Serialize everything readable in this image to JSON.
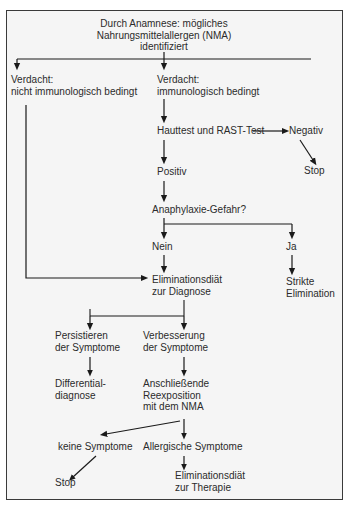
{
  "figure": {
    "type": "flowchart",
    "language": "de",
    "caption_remnant": "",
    "background_color": "#f5f5f5",
    "border_color": "#3a3a3a",
    "text_color": "#2b2b2b",
    "arrow_color": "#1a1a1a"
  },
  "nodes": [
    {
      "id": "start",
      "label": "Durch Anamnese: mögliches\nNahrungsmittelallergen (NMA)\nidentifiziert",
      "x": 164,
      "y": 18,
      "align": "center"
    },
    {
      "id": "verdacht-nicht-immun",
      "label": "Verdacht:\nnicht immunologisch bedingt",
      "x": 11,
      "y": 74,
      "align": "left"
    },
    {
      "id": "verdacht-immun",
      "label": "Verdacht:\nimmunologisch bedingt",
      "x": 157,
      "y": 74,
      "align": "left"
    },
    {
      "id": "hauttest-rast",
      "label": "Hauttest und RAST-Test",
      "x": 157,
      "y": 127,
      "align": "left"
    },
    {
      "id": "negativ",
      "label": "Negativ",
      "x": 292,
      "y": 127,
      "align": "left"
    },
    {
      "id": "stop-negativ",
      "label": "Stop",
      "x": 304,
      "y": 168,
      "align": "left"
    },
    {
      "id": "positiv",
      "label": "Positiv",
      "x": 157,
      "y": 168,
      "align": "left"
    },
    {
      "id": "anaphylaxie-gefahr",
      "label": "Anaphylaxie-Gefahr?",
      "x": 152,
      "y": 205,
      "align": "left"
    },
    {
      "id": "nein",
      "label": "Nein",
      "x": 152,
      "y": 242,
      "align": "left"
    },
    {
      "id": "ja",
      "label": "Ja",
      "x": 286,
      "y": 242,
      "align": "left"
    },
    {
      "id": "strikte-elimination",
      "label": "Strikte\nElimination",
      "x": 286,
      "y": 277,
      "align": "left"
    },
    {
      "id": "eliminationsdiaet-diagnose",
      "label": "Eliminationsdiät\nzur Diagnose",
      "x": 152,
      "y": 275,
      "align": "left"
    },
    {
      "id": "persistieren",
      "label": "Persistieren\nder Symptome",
      "x": 57,
      "y": 331,
      "align": "left"
    },
    {
      "id": "verbesserung",
      "label": "Verbesserung\nder Symptome",
      "x": 143,
      "y": 331,
      "align": "left"
    },
    {
      "id": "differentialdiagnose",
      "label": "Differential-\ndiagnose",
      "x": 57,
      "y": 380,
      "align": "left"
    },
    {
      "id": "reexposition",
      "label": "Anschließende\nReexposition\nmit dem NMA",
      "x": 143,
      "y": 380,
      "align": "left"
    },
    {
      "id": "keine-symptome",
      "label": "keine Symptome",
      "x": 60,
      "y": 443,
      "align": "left"
    },
    {
      "id": "allergische-symptome",
      "label": "Allergische Symptome",
      "x": 143,
      "y": 443,
      "align": "left"
    },
    {
      "id": "stop-keine-symptome",
      "label": "Stop",
      "x": 57,
      "y": 478,
      "align": "left"
    },
    {
      "id": "eliminationsdiaet-therapie",
      "label": "Eliminationsdiät\nzur Therapie",
      "x": 175,
      "y": 472,
      "align": "left"
    }
  ],
  "edges": [
    {
      "from": "start",
      "to": "verdacht-nicht-immun",
      "style": "elbow"
    },
    {
      "from": "start",
      "to": "verdacht-immun",
      "style": "elbow"
    },
    {
      "from": "verdacht-immun",
      "to": "hauttest-rast",
      "style": "straight"
    },
    {
      "from": "hauttest-rast",
      "to": "negativ",
      "style": "horizontal"
    },
    {
      "from": "negativ",
      "to": "stop-negativ",
      "style": "diagonal"
    },
    {
      "from": "hauttest-rast",
      "to": "positiv",
      "style": "straight"
    },
    {
      "from": "positiv",
      "to": "anaphylaxie-gefahr",
      "style": "straight"
    },
    {
      "from": "anaphylaxie-gefahr",
      "to": "nein",
      "style": "straight"
    },
    {
      "from": "anaphylaxie-gefahr",
      "to": "ja",
      "style": "elbow"
    },
    {
      "from": "ja",
      "to": "strikte-elimination",
      "style": "straight"
    },
    {
      "from": "nein",
      "to": "eliminationsdiaet-diagnose",
      "style": "straight"
    },
    {
      "from": "verdacht-nicht-immun",
      "to": "eliminationsdiaet-diagnose",
      "style": "elbow-left"
    },
    {
      "from": "eliminationsdiaet-diagnose",
      "to": "persistieren",
      "style": "elbow"
    },
    {
      "from": "eliminationsdiaet-diagnose",
      "to": "verbesserung",
      "style": "elbow"
    },
    {
      "from": "persistieren",
      "to": "differentialdiagnose",
      "style": "straight"
    },
    {
      "from": "verbesserung",
      "to": "reexposition",
      "style": "straight"
    },
    {
      "from": "reexposition",
      "to": "keine-symptome",
      "style": "diagonal"
    },
    {
      "from": "reexposition",
      "to": "allergische-symptome",
      "style": "straight"
    },
    {
      "from": "keine-symptome",
      "to": "stop-keine-symptome",
      "style": "diagonal"
    },
    {
      "from": "allergische-symptome",
      "to": "eliminationsdiaet-therapie",
      "style": "straight"
    }
  ]
}
